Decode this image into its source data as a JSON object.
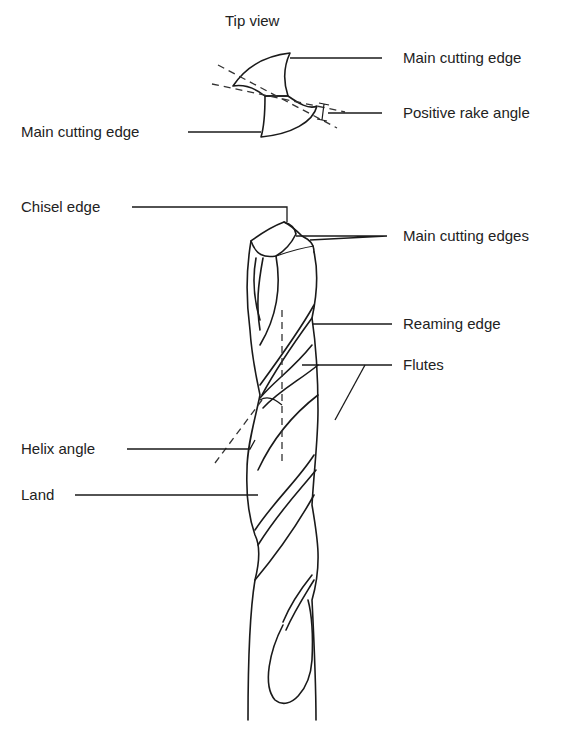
{
  "diagram": {
    "tip_view": {
      "title": "Tip view",
      "labels": {
        "main_cutting_edge_right": "Main cutting edge",
        "positive_rake_angle": "Positive rake angle",
        "main_cutting_edge_left": "Main cutting edge"
      }
    },
    "side_view": {
      "labels": {
        "chisel_edge": "Chisel edge",
        "main_cutting_edges": "Main cutting edges",
        "reaming_edge": "Reaming edge",
        "flutes": "Flutes",
        "helix_angle": "Helix angle",
        "land": "Land"
      }
    },
    "colors": {
      "line": "#1a1a1a",
      "text": "#222222",
      "background": "#ffffff"
    }
  }
}
